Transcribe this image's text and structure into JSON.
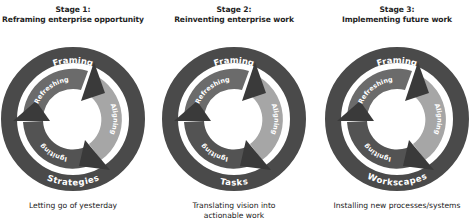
{
  "diagram": {
    "colors": {
      "outer_ring": "#4a4a4a",
      "refreshing_segment": "#6b6b6b",
      "aligning_segment": "#a6a6a6",
      "igniting_segment": "#535353",
      "arrowhead": "#3a3a3a",
      "ring_text": "#ffffff",
      "background": "#ffffff"
    },
    "stages": [
      {
        "title_line1": "Stage 1:",
        "title_line2": "Reframing enterprise opportunity",
        "outer_top_label": "Framing",
        "outer_bottom_label": "Strategies",
        "inner_labels": {
          "refreshing": "Refreshing",
          "aligning": "Aligning",
          "igniting": "Igniting"
        },
        "caption_line1": "Letting go of yesterday",
        "caption_line2": ""
      },
      {
        "title_line1": "Stage 2:",
        "title_line2": "Reinventing enterprise work",
        "outer_top_label": "Framing",
        "outer_bottom_label": "Tasks",
        "inner_labels": {
          "refreshing": "Refreshing",
          "aligning": "Aligning",
          "igniting": "Igniting"
        },
        "caption_line1": "Translating vision into",
        "caption_line2": "actionable work"
      },
      {
        "title_line1": "Stage 3:",
        "title_line2": "Implementing future work",
        "outer_top_label": "Framing",
        "outer_bottom_label": "Workscapes",
        "inner_labels": {
          "refreshing": "Refreshing",
          "aligning": "Aligning",
          "igniting": "Igniting"
        },
        "caption_line1": "Installing new processes/systems",
        "caption_line2": ""
      }
    ]
  }
}
